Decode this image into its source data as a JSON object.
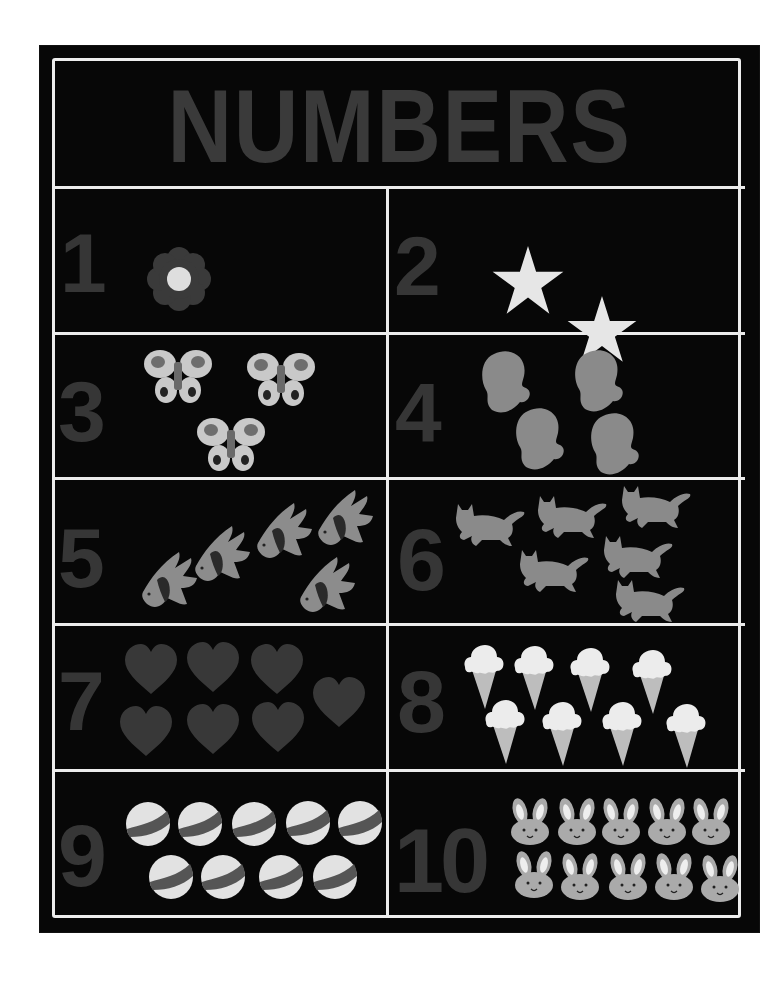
{
  "title": "NUMBERS",
  "colors": {
    "background": "#070707",
    "stitching": "#ececec",
    "numeral": "#363636",
    "light_felt": "#dcdcdc",
    "mid_felt": "#8a8a8a",
    "dark_felt": "#3c3c3c"
  },
  "cells": [
    {
      "number": "1",
      "count": 1,
      "object": "flower",
      "label": "flower-icon"
    },
    {
      "number": "2",
      "count": 2,
      "object": "star",
      "label": "star-icon"
    },
    {
      "number": "3",
      "count": 3,
      "object": "butterfly",
      "label": "butterfly-icon"
    },
    {
      "number": "4",
      "count": 4,
      "object": "mitten",
      "label": "mitten-icon"
    },
    {
      "number": "5",
      "count": 5,
      "object": "angelfish",
      "label": "fish-icon"
    },
    {
      "number": "6",
      "count": 6,
      "object": "cat",
      "label": "cat-icon"
    },
    {
      "number": "7",
      "count": 7,
      "object": "heart",
      "label": "heart-icon"
    },
    {
      "number": "8",
      "count": 8,
      "object": "ice cream cone",
      "label": "ice-cream-icon"
    },
    {
      "number": "9",
      "count": 9,
      "object": "ball",
      "label": "ball-icon"
    },
    {
      "number": "10",
      "count": 10,
      "object": "bunny",
      "label": "bunny-icon"
    }
  ]
}
